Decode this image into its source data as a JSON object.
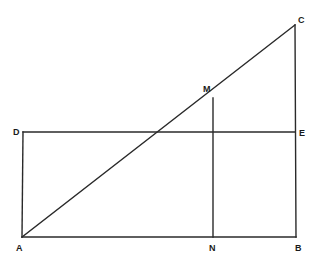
{
  "diagram": {
    "type": "geometric-figure",
    "line_color": "#2a2a2a",
    "background": "#ffffff",
    "points": {
      "A": {
        "x": 22,
        "y": 237
      },
      "B": {
        "x": 296,
        "y": 237
      },
      "C": {
        "x": 295,
        "y": 25
      },
      "D": {
        "x": 23,
        "y": 132
      },
      "E": {
        "x": 295,
        "y": 132
      },
      "M": {
        "x": 213,
        "y": 98
      },
      "N": {
        "x": 213,
        "y": 237
      }
    },
    "segments": [
      {
        "name": "AB",
        "from": "A",
        "to": "B"
      },
      {
        "name": "BC",
        "from": "B",
        "to": "C"
      },
      {
        "name": "AC",
        "from": "A",
        "to": "C"
      },
      {
        "name": "AD",
        "from": "A",
        "to": "D"
      },
      {
        "name": "DE",
        "from": "D",
        "to": "E"
      },
      {
        "name": "MN",
        "from": "M",
        "to": "N"
      }
    ],
    "labels": [
      {
        "text": "A",
        "x": 16,
        "y": 251
      },
      {
        "text": "B",
        "x": 295,
        "y": 251
      },
      {
        "text": "C",
        "x": 298,
        "y": 23
      },
      {
        "text": "D",
        "x": 13,
        "y": 135
      },
      {
        "text": "E",
        "x": 299,
        "y": 136
      },
      {
        "text": "M",
        "x": 203,
        "y": 92
      },
      {
        "text": "N",
        "x": 209,
        "y": 251
      }
    ]
  }
}
